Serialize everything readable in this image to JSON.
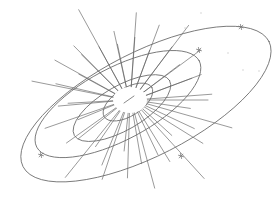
{
  "image": {
    "description": "Pencil sketch of a bright central body with radiating rays surrounded by nested tilted elliptical orbits and small star marks",
    "colors": {
      "background": "#ffffff",
      "line": "#6b6b6b",
      "ray": "#555555",
      "star": "#777777",
      "speck": "#c8c8c8"
    }
  },
  "core": {
    "cx": 130,
    "cy": 100,
    "rx": 17,
    "ry": 13
  },
  "rays": {
    "count": 44,
    "inner_radius": 16,
    "lengths": [
      62,
      45,
      90,
      55,
      70,
      40,
      95,
      60,
      48,
      80,
      52,
      66,
      38,
      72,
      58,
      44,
      88,
      50,
      62,
      40,
      74,
      56,
      46,
      84,
      60,
      42,
      70,
      52,
      64,
      48,
      92,
      58,
      44,
      76,
      50,
      68,
      40,
      82,
      54,
      46,
      72,
      60,
      50,
      66
    ]
  },
  "orbits": [
    {
      "name": "inner-orbit",
      "cx": 128,
      "cy": 102,
      "rx": 28,
      "ry": 14,
      "rotate": -32
    },
    {
      "name": "second-orbit",
      "cx": 122,
      "cy": 108,
      "rx": 55,
      "ry": 22,
      "rotate": -30
    },
    {
      "name": "third-orbit",
      "cx": 118,
      "cy": 104,
      "rx": 92,
      "ry": 36,
      "rotate": -28
    },
    {
      "name": "outer-orbit",
      "cx": 146,
      "cy": 104,
      "rx": 138,
      "ry": 52,
      "rotate": -27
    }
  ],
  "stars": [
    {
      "name": "star-upper-middle",
      "x": 199,
      "y": 50
    },
    {
      "name": "star-upper-right",
      "x": 241,
      "y": 27
    },
    {
      "name": "star-lower-left",
      "x": 41,
      "y": 155
    },
    {
      "name": "star-lower-right",
      "x": 181,
      "y": 156
    }
  ],
  "specks": [
    {
      "x": 201,
      "y": 13
    },
    {
      "x": 228,
      "y": 53
    },
    {
      "x": 243,
      "y": 70
    },
    {
      "x": 259,
      "y": 71
    },
    {
      "x": 185,
      "y": 28
    }
  ]
}
